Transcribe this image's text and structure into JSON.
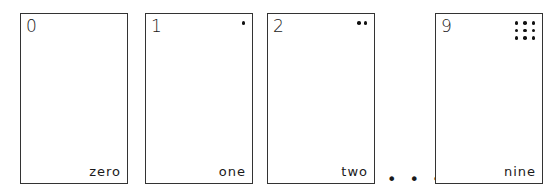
{
  "cards": [
    {
      "numeral": "0",
      "word": "zero",
      "pips": 0,
      "left": 20
    },
    {
      "numeral": "1",
      "word": "one",
      "pips": 1,
      "left": 145
    },
    {
      "numeral": "2",
      "word": "two",
      "pips": 2,
      "left": 267
    },
    {
      "numeral": "9",
      "word": "nine",
      "pips": 9,
      "left": 435
    }
  ],
  "ellipsis": "• • •"
}
